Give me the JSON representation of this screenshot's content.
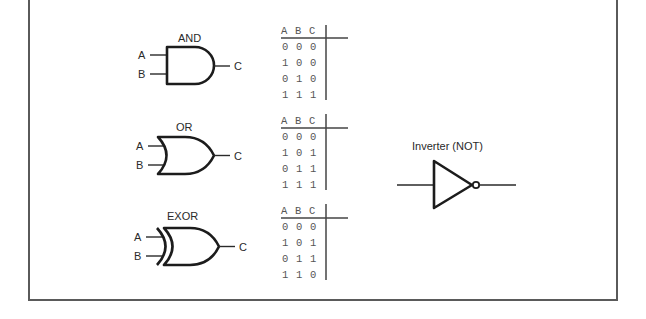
{
  "diagram": {
    "gates": [
      {
        "name": "AND",
        "label": "AND",
        "inputs": [
          "A",
          "B"
        ],
        "output": "C",
        "truth_table": {
          "headers": [
            "A",
            "B",
            "C"
          ],
          "rows": [
            [
              "0",
              "0",
              "0"
            ],
            [
              "1",
              "0",
              "0"
            ],
            [
              "0",
              "1",
              "0"
            ],
            [
              "1",
              "1",
              "1"
            ]
          ]
        }
      },
      {
        "name": "OR",
        "label": "OR",
        "inputs": [
          "A",
          "B"
        ],
        "output": "C",
        "truth_table": {
          "headers": [
            "A",
            "B",
            "C"
          ],
          "rows": [
            [
              "0",
              "0",
              "0"
            ],
            [
              "1",
              "0",
              "1"
            ],
            [
              "0",
              "1",
              "1"
            ],
            [
              "1",
              "1",
              "1"
            ]
          ]
        }
      },
      {
        "name": "EXOR",
        "label": "EXOR",
        "inputs": [
          "A",
          "B"
        ],
        "output": "C",
        "truth_table": {
          "headers": [
            "A",
            "B",
            "C"
          ],
          "rows": [
            [
              "0",
              "0",
              "0"
            ],
            [
              "1",
              "0",
              "1"
            ],
            [
              "0",
              "1",
              "1"
            ],
            [
              "1",
              "1",
              "0"
            ]
          ]
        }
      }
    ],
    "inverter": {
      "label": "Inverter (NOT)"
    }
  }
}
